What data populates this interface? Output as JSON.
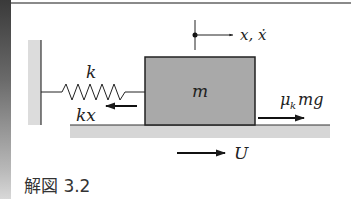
{
  "figure": {
    "caption": "解図 3.2",
    "labels": {
      "spring_constant": "k",
      "mass": "m",
      "position": "x, ẋ",
      "spring_force": "kx",
      "friction_force_mu": "μ",
      "friction_force_sub": "k",
      "friction_force_rest": "mg",
      "belt_velocity": "U"
    },
    "colors": {
      "mass_fill": "#a9a9a9",
      "ground_fill": "#d6d6d6",
      "wall_fill": "#dcdcdc",
      "line": "#1a1a1a",
      "left_bar_dark": "#3a3a3a"
    }
  }
}
